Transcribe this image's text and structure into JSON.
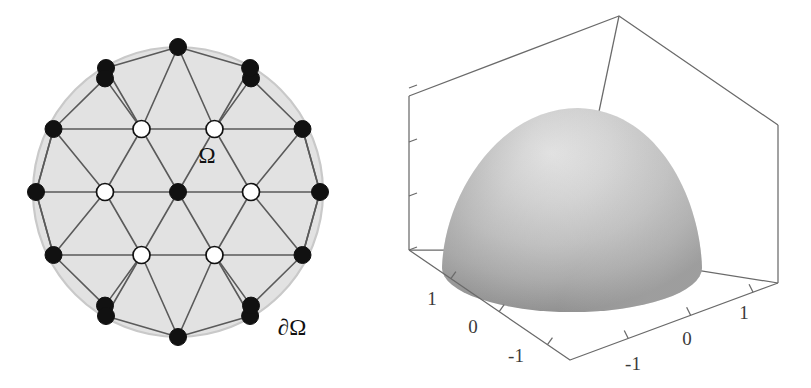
{
  "figure": {
    "panels": [
      {
        "id": "mesh",
        "caption_labels": [
          "Ω",
          "∂Ω"
        ]
      },
      {
        "id": "surface",
        "caption_labels": []
      }
    ]
  },
  "mesh_panel": {
    "name": "triangulated-disk-mesh",
    "domain_label": "Ω",
    "boundary_label": "∂Ω",
    "domain_label_pos": {
      "x": 207,
      "y": 158
    },
    "boundary_label_pos": {
      "x": 292,
      "y": 330
    },
    "circle": {
      "cx": 178,
      "cy": 192,
      "r": 145
    },
    "colors": {
      "fill": "#e2e2e2",
      "circle_stroke": "#c9c9c9",
      "edge": "#5a5a5a",
      "boundary_node": "#111111",
      "interior_node": "#ffffff",
      "node_stroke": "#111111"
    },
    "node_radius": 8.5,
    "spacing": 72.5,
    "boundary_nodes": [
      {
        "id": "b0",
        "x": 320.0,
        "y": 192.0
      },
      {
        "id": "b1",
        "x": 302.5,
        "y": 129.0
      },
      {
        "id": "b2",
        "x": 251.0,
        "y": 78.4
      },
      {
        "id": "b3",
        "x": 250.1,
        "y": 68.0
      },
      {
        "id": "b4",
        "x": 178.0,
        "y": 47.0
      },
      {
        "id": "b5",
        "x": 106.0,
        "y": 68.0
      },
      {
        "id": "b6",
        "x": 105.0,
        "y": 78.4
      },
      {
        "id": "b7",
        "x": 53.5,
        "y": 129.0
      },
      {
        "id": "b8",
        "x": 36.0,
        "y": 192.0
      },
      {
        "id": "b9",
        "x": 53.5,
        "y": 255.0
      },
      {
        "id": "b10",
        "x": 105.0,
        "y": 305.6
      },
      {
        "id": "b11",
        "x": 106.0,
        "y": 316.0
      },
      {
        "id": "b12",
        "x": 178.0,
        "y": 337.0
      },
      {
        "id": "b13",
        "x": 250.1,
        "y": 316.0
      },
      {
        "id": "b14",
        "x": 251.0,
        "y": 305.6
      },
      {
        "id": "b15",
        "x": 302.5,
        "y": 255.0
      }
    ],
    "interior_nodes": [
      {
        "id": "i0",
        "x": 178.0,
        "y": 192.0,
        "kind": "black"
      },
      {
        "id": "i1",
        "x": 141.5,
        "y": 129.0,
        "kind": "white"
      },
      {
        "id": "i2",
        "x": 214.5,
        "y": 129.0,
        "kind": "white"
      },
      {
        "id": "i3",
        "x": 105.0,
        "y": 192.0,
        "kind": "white"
      },
      {
        "id": "i4",
        "x": 251.0,
        "y": 192.0,
        "kind": "white"
      },
      {
        "id": "i5",
        "x": 141.5,
        "y": 255.0,
        "kind": "white"
      },
      {
        "id": "i6",
        "x": 214.5,
        "y": 255.0,
        "kind": "white"
      }
    ],
    "node_legend": {
      "boundary": "filled-black-node",
      "interior": "open-white-node",
      "center": "filled-black-node"
    }
  },
  "surface_panel": {
    "name": "3d-surface-plot",
    "type": "surface",
    "colors": {
      "axis": "#6a6a6a",
      "tick": "#6a6a6a",
      "label": "#3b3b3b",
      "surface_light": "#d8d8d8",
      "surface_mid": "#bdbdbd",
      "surface_dark": "#8f8f8f"
    },
    "z_axis": {
      "name": "z-axis",
      "ticks": [
        "0",
        "1",
        "2",
        "3"
      ],
      "tick_positions_px": [
        250,
        196,
        142,
        88
      ],
      "label_x_px": 396
    },
    "x_axis": {
      "name": "x-axis-left",
      "ticks": [
        "1",
        "0",
        "-1"
      ],
      "tick_label_positions_px": [
        {
          "x": 432,
          "y": 305
        },
        {
          "x": 473,
          "y": 333
        },
        {
          "x": 516,
          "y": 362
        }
      ]
    },
    "y_axis": {
      "name": "y-axis-right",
      "ticks": [
        "-1",
        "0",
        "1"
      ],
      "tick_label_positions_px": [
        {
          "x": 633,
          "y": 370
        },
        {
          "x": 687,
          "y": 345
        },
        {
          "x": 744,
          "y": 319
        }
      ]
    },
    "box": {
      "top_back": {
        "x": 619,
        "y": 16
      },
      "left_top": {
        "x": 409,
        "y": 96
      },
      "right_top": {
        "x": 778,
        "y": 125
      },
      "left_bottom": {
        "x": 409,
        "y": 250
      },
      "right_bottom": {
        "x": 778,
        "y": 283
      },
      "front_bottom": {
        "x": 570,
        "y": 360
      }
    }
  },
  "chart_data": {
    "type": "surface",
    "title": "",
    "xlabel": "",
    "ylabel": "",
    "zlabel": "",
    "xlim": [
      -1.5,
      1.5
    ],
    "ylim": [
      -1.5,
      1.5
    ],
    "zlim": [
      0,
      3
    ],
    "xticks": [
      -1,
      0,
      1
    ],
    "yticks": [
      -1,
      0,
      1
    ],
    "zticks": [
      0,
      1,
      2,
      3
    ],
    "grid": false,
    "legend": "none",
    "peak_value": 2.8,
    "boundary_value": 0
  }
}
